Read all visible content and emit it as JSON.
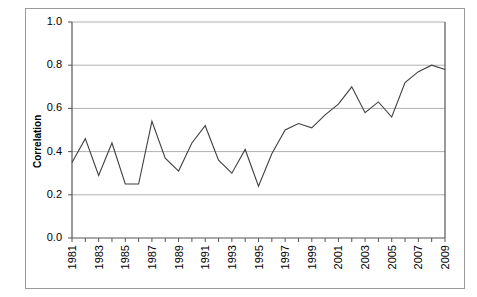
{
  "chart_data": {
    "type": "line",
    "title": "",
    "subtitle": "",
    "xlabel": "",
    "ylabel": "Correlation",
    "x": [
      1981,
      1982,
      1983,
      1984,
      1985,
      1986,
      1987,
      1988,
      1989,
      1990,
      1991,
      1992,
      1993,
      1994,
      1995,
      1996,
      1997,
      1998,
      1999,
      2000,
      2001,
      2002,
      2003,
      2004,
      2005,
      2006,
      2007,
      2008,
      2009
    ],
    "values": [
      0.35,
      0.46,
      0.29,
      0.44,
      0.25,
      0.25,
      0.54,
      0.37,
      0.31,
      0.44,
      0.52,
      0.36,
      0.3,
      0.41,
      0.24,
      0.39,
      0.5,
      0.53,
      0.51,
      0.57,
      0.62,
      0.7,
      0.58,
      0.63,
      0.56,
      0.72,
      0.77,
      0.8,
      0.78
    ],
    "series": [
      {
        "name": "Correlation",
        "values": [
          0.35,
          0.46,
          0.29,
          0.44,
          0.25,
          0.25,
          0.54,
          0.37,
          0.31,
          0.44,
          0.52,
          0.36,
          0.3,
          0.41,
          0.24,
          0.39,
          0.5,
          0.53,
          0.51,
          0.57,
          0.62,
          0.7,
          0.58,
          0.63,
          0.56,
          0.72,
          0.77,
          0.8,
          0.78
        ],
        "color": "#404040"
      }
    ],
    "ylim": [
      0.0,
      1.0
    ],
    "xlim": [
      1981,
      2009
    ],
    "ytick_labels": [
      "1.0",
      "0.8",
      "0.6",
      "0.4",
      "0.2",
      "0.0"
    ],
    "ytick_values": [
      1.0,
      0.8,
      0.6,
      0.4,
      0.2,
      0.0
    ],
    "xtick_labels": [
      "1981",
      "1982",
      "1983",
      "1984",
      "1985",
      "1986",
      "1987",
      "1988",
      "1989",
      "1990",
      "1991",
      "1992",
      "1993",
      "1994",
      "1995",
      "1996",
      "1997",
      "1998",
      "1999",
      "2000",
      "2001",
      "2002",
      "2003",
      "2004",
      "2005",
      "2006",
      "2007",
      "2008",
      "2009"
    ],
    "xtick_labels_visible": [
      "1981",
      "1983",
      "1985",
      "1987",
      "1989",
      "1991",
      "1993",
      "1995",
      "1997",
      "1999",
      "2001",
      "2003",
      "2005",
      "2007",
      "2009"
    ],
    "grid": "horizontal",
    "legend": "none",
    "gridline_color": "#b0b0b0",
    "axis_color": "#555555",
    "line_color": "#404040",
    "background": "#ffffff"
  }
}
